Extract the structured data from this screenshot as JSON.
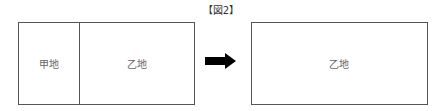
{
  "figure": {
    "title": "【図2】",
    "before": {
      "parcels": [
        {
          "label": "甲地"
        },
        {
          "label": "乙地"
        }
      ]
    },
    "arrow": "right-arrow",
    "after": {
      "parcels": [
        {
          "label": "乙地"
        }
      ]
    }
  }
}
